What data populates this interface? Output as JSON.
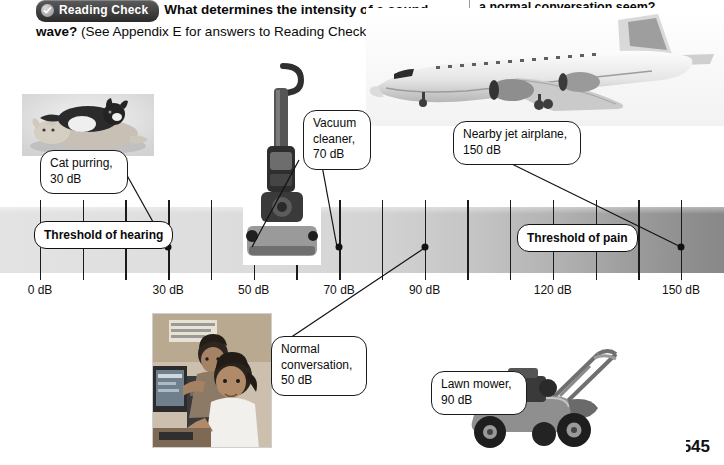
{
  "header": {
    "badge_label": "Reading Check",
    "badge_icon": "check-circle-icon",
    "question_bold": "What determines the intensity of a sound wave?",
    "question_note": "(See Appendix E for answers to Reading Checks.)",
    "right_column_text": "a normal conversation seem?"
  },
  "scale": {
    "unit": "dB",
    "axis_labels": [
      {
        "value": 0,
        "label": "0 dB"
      },
      {
        "value": 30,
        "label": "30 dB"
      },
      {
        "value": 50,
        "label": "50 dB"
      },
      {
        "value": 70,
        "label": "70 dB"
      },
      {
        "value": 90,
        "label": "90 dB"
      },
      {
        "value": 120,
        "label": "120 dB"
      },
      {
        "value": 150,
        "label": "150 dB"
      }
    ],
    "threshold_hearing": "Threshold\nof hearing",
    "threshold_pain": "Threshold\nof pain",
    "marked_points": [
      30,
      50,
      70,
      90,
      150
    ]
  },
  "callouts": [
    {
      "id": "cat",
      "text": "Cat purring,\n30 dB",
      "db": 30
    },
    {
      "id": "vacuum",
      "text": "Vacuum\ncleaner,\n70 dB",
      "db": 70
    },
    {
      "id": "jet",
      "text": "Nearby jet airplane,\n150 dB",
      "db": 150
    },
    {
      "id": "convo",
      "text": "Normal\nconversation,\n50 dB",
      "db": 50
    },
    {
      "id": "mower",
      "text": "Lawn mower,\n90 dB",
      "db": 90
    }
  ],
  "photos": {
    "cats": "two-cats-sleeping-photo",
    "vacuum": "upright-vacuum-cleaner-photo",
    "jet": "jet-airplane-photo",
    "lab": "students-at-computer-photo",
    "mower": "lawn-mower-photo"
  },
  "page_number": "545",
  "chart_data": {
    "type": "bar",
    "xlabel": "dB",
    "ylabel": "",
    "xlim": [
      -10,
      160
    ],
    "categories": [
      "Cat purring",
      "Normal conversation",
      "Vacuum cleaner",
      "Lawn mower",
      "Nearby jet airplane"
    ],
    "values": [
      30,
      50,
      70,
      90,
      150
    ],
    "tick_labels": [
      "0 dB",
      "30 dB",
      "50 dB",
      "70 dB",
      "90 dB",
      "120 dB",
      "150 dB"
    ],
    "tick_values": [
      0,
      30,
      50,
      70,
      90,
      120,
      150
    ],
    "annotations": [
      "Threshold of hearing",
      "Threshold of pain"
    ],
    "grid": false,
    "legend": "none"
  }
}
